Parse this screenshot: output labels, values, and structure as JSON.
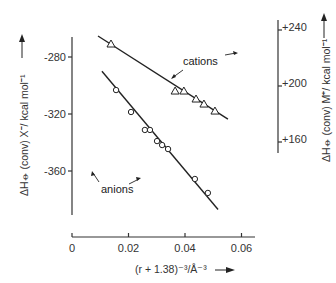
{
  "chart_data": {
    "type": "scatter",
    "title": "",
    "xlabel": "(r + 1.38)⁻³/Å⁻³",
    "ylabel_left": "ΔH⦵ (conv) X⁻/ kcal mol⁻¹",
    "ylabel_right": "ΔH⦵ (conv) M⁺/ kcal mol⁻¹",
    "xlim": [
      0,
      0.065
    ],
    "ylim_left": [
      -395,
      -265
    ],
    "ylim_right": [
      145,
      245
    ],
    "x_ticks": [
      0,
      0.02,
      0.04,
      0.06
    ],
    "x_tick_labels": [
      "0",
      "0.02",
      "0.04",
      "0.06"
    ],
    "y_left_ticks": [
      -280,
      -320,
      -360
    ],
    "y_left_tick_labels": [
      "-280",
      "-320",
      "-360"
    ],
    "y_right_ticks": [
      240,
      200,
      160
    ],
    "y_right_tick_labels": [
      "+240",
      "+200",
      "+160"
    ],
    "grid": false,
    "series": [
      {
        "name": "cations",
        "axis": "right",
        "marker": "triangle",
        "x": [
          0.0138,
          0.0365,
          0.0396,
          0.0439,
          0.0467,
          0.0506
        ],
        "y": [
          230,
          196.4,
          196.4,
          190.7,
          187.1,
          182.1
        ],
        "fit_line": {
          "x": [
            0.0092,
            0.0552
          ],
          "y": [
            235.7,
            176.4
          ]
        }
      },
      {
        "name": "anions",
        "axis": "left",
        "marker": "circle",
        "x": [
          0.0156,
          0.0209,
          0.0258,
          0.0276,
          0.0301,
          0.0319,
          0.034,
          0.0435,
          0.0481
        ],
        "y": [
          -303.2,
          -318.6,
          -331.2,
          -331.2,
          -339,
          -341.8,
          -344.6,
          -365.6,
          -375.4
        ],
        "fit_line": {
          "x": [
            0.0106,
            0.0517
          ],
          "y": [
            -290,
            -387
          ]
        }
      }
    ],
    "annotations": [
      {
        "text": "cations",
        "points_to": "cations line"
      },
      {
        "text": "anions",
        "points_to": "anions line"
      }
    ]
  }
}
